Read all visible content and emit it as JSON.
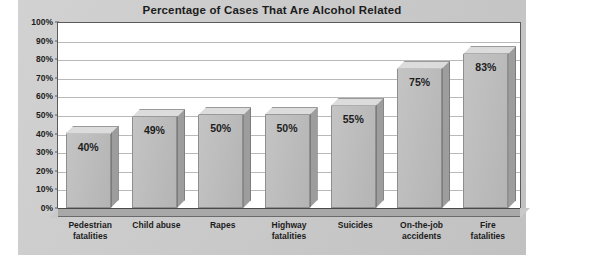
{
  "chart_data": {
    "type": "bar",
    "title": "Percentage of Cases That Are Alcohol Related",
    "xlabel": "",
    "ylabel": "",
    "ylim": [
      0,
      100
    ],
    "grid": true,
    "legend": "none",
    "categories": [
      "Pedestrian fatalities",
      "Child abuse",
      "Rapes",
      "Highway fatalities",
      "Suicides",
      "On-the-job accidents",
      "Fire fatalities"
    ],
    "values": [
      40,
      49,
      50,
      50,
      55,
      75,
      83
    ],
    "data_labels": [
      "40%",
      "49%",
      "50%",
      "50%",
      "55%",
      "75%",
      "83%"
    ],
    "y_ticks": [
      0,
      10,
      20,
      30,
      40,
      50,
      60,
      70,
      80,
      90,
      100
    ],
    "y_tick_labels": [
      "0%",
      "10%",
      "20%",
      "30%",
      "40%",
      "50%",
      "60%",
      "70%",
      "80%",
      "90%",
      "100%"
    ]
  },
  "category_lines": [
    [
      "Pedestrian",
      "fatalities"
    ],
    [
      "Child abuse",
      ""
    ],
    [
      "Rapes",
      ""
    ],
    [
      "Highway",
      "fatalities"
    ],
    [
      "Suicides",
      ""
    ],
    [
      "On-the-job",
      "accidents"
    ],
    [
      "Fire",
      "fatalities"
    ]
  ],
  "colors": {
    "panel_background": "#c9c9c9",
    "plot_background": "#ffffff",
    "bar_front": "#bdbdbd",
    "bar_top": "#dcdcdc",
    "bar_side": "#9d9d9d",
    "gridline": "#b9b9b9",
    "axis_line": "#5a5a5a",
    "text": "#1c1c1c",
    "floor": "#a8a8a8"
  }
}
